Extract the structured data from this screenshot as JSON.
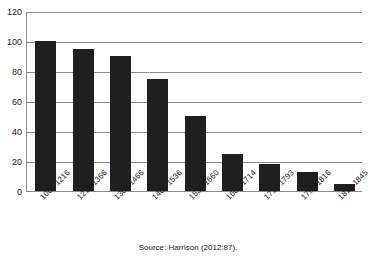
{
  "chart_data": {
    "type": "bar",
    "title": "",
    "subtitle": "",
    "xlabel": "",
    "ylabel": "",
    "categories": [
      "1066-1216",
      "1216-1366",
      "1366-1466",
      "1466-1536",
      "1536-1660",
      "1660-1714",
      "1714-1793",
      "1793-1816",
      "1816-1845"
    ],
    "values": [
      100,
      95,
      90,
      75,
      50,
      25,
      18,
      13,
      5
    ],
    "ylim": [
      0,
      120
    ],
    "ytick_labels": [
      "120",
      "100",
      "80",
      "60",
      "40",
      "20",
      "0"
    ],
    "ytick_values": [
      120,
      100,
      80,
      60,
      40,
      20,
      0
    ],
    "grid": "horizontal",
    "legend": "none",
    "bar_color": "#1f1f1f",
    "grid_color": "#8a8a8a",
    "axis_color": "#8a8a8a",
    "background_color": "#ffffff"
  },
  "caption": {
    "source_text": "Source: Harrison (2012:87)."
  }
}
